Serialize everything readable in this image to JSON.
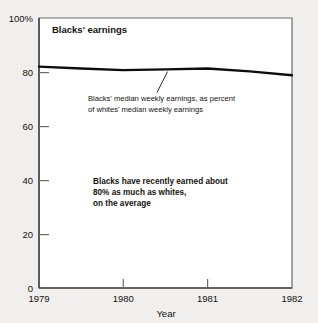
{
  "chart_data": {
    "type": "line",
    "title": "Blacks' earnings",
    "xlabel": "Year",
    "ylabel": "",
    "xlim": [
      1979,
      1982
    ],
    "ylim": [
      0,
      100
    ],
    "grid": false,
    "legend": "none",
    "x_ticks": [
      "1979",
      "1980",
      "1981",
      "1982"
    ],
    "x_tick_values": [
      1979,
      1980,
      1981,
      1982
    ],
    "y_ticks": [
      "0",
      "20",
      "40",
      "60",
      "80",
      "100%"
    ],
    "y_tick_values": [
      0,
      20,
      40,
      60,
      80,
      100
    ],
    "series": [
      {
        "name": "Blacks' median weekly earnings, as percent of whites' median weekly earnings",
        "x": [
          1979.0,
          1979.5,
          1980.0,
          1980.5,
          1981.0,
          1981.5,
          1982.0
        ],
        "values": [
          82.0,
          81.3,
          80.7,
          81.0,
          81.3,
          80.2,
          78.8
        ]
      }
    ],
    "annotations": [
      {
        "name": "series-callout",
        "line1": "Blacks' median weekly earnings, as percent",
        "line2": "of whites' median weekly earnings",
        "leader_from": [
          1980.8,
          81.2
        ],
        "leader_to": [
          1980.5,
          73.0
        ]
      },
      {
        "name": "summary-note",
        "line1": "Blacks have recently earned about",
        "line2": "80% as much as whites,",
        "line3": "on the average"
      }
    ],
    "colors": {
      "page_background": "#f1efed",
      "plot_background": "#ffffff",
      "axis": "#5b5b5b",
      "series_line": "#0d0d0d",
      "text": "#14120e"
    }
  },
  "axes": {
    "y_tick_0": "0",
    "y_tick_20": "20",
    "y_tick_40": "40",
    "y_tick_60": "60",
    "y_tick_80": "80",
    "y_tick_100": "100%",
    "x_tick_1979": "1979",
    "x_tick_1980": "1980",
    "x_tick_1981": "1981",
    "x_tick_1982": "1982",
    "x_axis_title": "Year"
  },
  "panel": {
    "title": "Blacks' earnings"
  },
  "callout": {
    "line1": "Blacks' median weekly earnings, as percent",
    "line2": "of whites' median weekly earnings"
  },
  "note": {
    "line1": "Blacks have recently earned about",
    "line2": "80% as much as whites,",
    "line3": "on the average"
  }
}
